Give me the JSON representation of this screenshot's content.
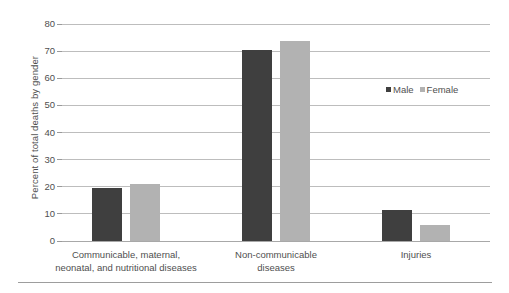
{
  "chart_data": {
    "type": "bar",
    "title": "",
    "subtitle": "",
    "xlabel": "",
    "ylabel": "Percent of total deaths by gender",
    "ylim": [
      0,
      80
    ],
    "yticks": [
      0,
      10,
      20,
      30,
      40,
      50,
      60,
      70,
      80
    ],
    "ytick_labels": [
      "0",
      "10",
      "20",
      "30",
      "40",
      "50",
      "60",
      "70",
      "80"
    ],
    "grid": true,
    "legend_position": "right-upper",
    "categories": [
      "Communicable, maternal, neonatal, and nutritional diseases",
      "Non-communicable diseases",
      "Injuries"
    ],
    "category_label_lines": [
      [
        "Communicable, maternal,",
        "neonatal, and nutritional diseases"
      ],
      [
        "Non-communicable",
        "diseases"
      ],
      [
        "Injuries"
      ]
    ],
    "series": [
      {
        "name": "Male",
        "color": "#3f3f3f",
        "values": [
          19.4,
          70.3,
          11.3
        ]
      },
      {
        "name": "Female",
        "color": "#b2b2b2",
        "values": [
          21.1,
          73.7,
          6.0
        ]
      }
    ],
    "annotations": []
  },
  "legend": {
    "items": [
      {
        "label": "Male",
        "swatch": "male-swatch"
      },
      {
        "label": "Female",
        "swatch": "female-swatch"
      }
    ]
  }
}
